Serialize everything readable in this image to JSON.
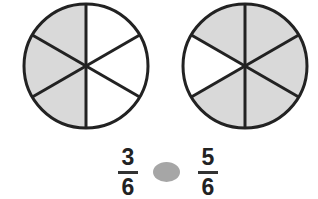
{
  "circles": [
    {
      "id": "left",
      "parts": 6,
      "shaded": 3
    },
    {
      "id": "right",
      "parts": 6,
      "shaded": 5
    }
  ],
  "fractions": [
    {
      "numerator": "3",
      "denominator": "6"
    },
    {
      "numerator": "5",
      "denominator": "6"
    }
  ],
  "comparison": {
    "symbol": "",
    "blank_color": "#a6a6a6"
  },
  "colors": {
    "shade": "#d9d9d9",
    "stroke": "#222222"
  }
}
